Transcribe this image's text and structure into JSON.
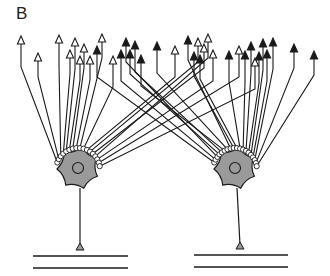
{
  "figure": {
    "label": "B",
    "colors": {
      "line": "#1a1a1a",
      "soma_fill": "#9a9a9a",
      "background": "#ffffff",
      "bouton_fill": "#ffffff"
    }
  },
  "neurons": [
    {
      "id": "left",
      "soma_center": [
        78,
        168
      ],
      "axon_end": [
        80,
        250
      ],
      "baseline_y": [
        256,
        268
      ],
      "baseline_x": [
        33,
        128
      ]
    },
    {
      "id": "right",
      "soma_center": [
        235,
        168
      ],
      "axon_end": [
        240,
        249
      ],
      "baseline_y": [
        255,
        267
      ],
      "baseline_x": [
        194,
        288
      ]
    }
  ],
  "arrows": [
    {
      "x": 21,
      "y": 38,
      "type": "open",
      "target": "left"
    },
    {
      "x": 38,
      "y": 55,
      "type": "open",
      "target": "left"
    },
    {
      "x": 59,
      "y": 37,
      "type": "open",
      "target": "left"
    },
    {
      "x": 70,
      "y": 52,
      "type": "open",
      "target": "left"
    },
    {
      "x": 75,
      "y": 40,
      "type": "open",
      "target": "left"
    },
    {
      "x": 80,
      "y": 58,
      "type": "open",
      "target": "left"
    },
    {
      "x": 84,
      "y": 46,
      "type": "open",
      "target": "left"
    },
    {
      "x": 90,
      "y": 58,
      "type": "open",
      "target": "left"
    },
    {
      "x": 97,
      "y": 48,
      "type": "filled",
      "target": "right"
    },
    {
      "x": 102,
      "y": 36,
      "type": "open",
      "target": "left"
    },
    {
      "x": 113,
      "y": 58,
      "type": "open",
      "target": "left"
    },
    {
      "x": 121,
      "y": 52,
      "type": "filled",
      "target": "right"
    },
    {
      "x": 126,
      "y": 40,
      "type": "filled",
      "target": "right"
    },
    {
      "x": 130,
      "y": 52,
      "type": "filled",
      "target": "right"
    },
    {
      "x": 135,
      "y": 43,
      "type": "filled",
      "target": "right"
    },
    {
      "x": 141,
      "y": 57,
      "type": "filled",
      "target": "right"
    },
    {
      "x": 157,
      "y": 44,
      "type": "filled",
      "target": "right"
    },
    {
      "x": 175,
      "y": 48,
      "type": "open",
      "target": "left"
    },
    {
      "x": 188,
      "y": 38,
      "type": "filled",
      "target": "right"
    },
    {
      "x": 194,
      "y": 54,
      "type": "filled",
      "target": "right"
    },
    {
      "x": 198,
      "y": 40,
      "type": "open",
      "target": "left"
    },
    {
      "x": 200,
      "y": 57,
      "type": "filled",
      "target": "right"
    },
    {
      "x": 204,
      "y": 46,
      "type": "open",
      "target": "left"
    },
    {
      "x": 208,
      "y": 36,
      "type": "open",
      "target": "left"
    },
    {
      "x": 213,
      "y": 52,
      "type": "open",
      "target": "left"
    },
    {
      "x": 229,
      "y": 53,
      "type": "filled",
      "target": "right"
    },
    {
      "x": 239,
      "y": 48,
      "type": "open",
      "target": "left"
    },
    {
      "x": 245,
      "y": 53,
      "type": "filled",
      "target": "right"
    },
    {
      "x": 251,
      "y": 44,
      "type": "filled",
      "target": "right"
    },
    {
      "x": 255,
      "y": 60,
      "type": "open",
      "target": "left"
    },
    {
      "x": 259,
      "y": 54,
      "type": "filled",
      "target": "right"
    },
    {
      "x": 263,
      "y": 41,
      "type": "filled",
      "target": "right"
    },
    {
      "x": 267,
      "y": 52,
      "type": "filled",
      "target": "right"
    },
    {
      "x": 273,
      "y": 40,
      "type": "filled",
      "target": "right"
    },
    {
      "x": 294,
      "y": 46,
      "type": "filled",
      "target": "right"
    },
    {
      "x": 314,
      "y": 53,
      "type": "filled",
      "target": "right"
    }
  ]
}
